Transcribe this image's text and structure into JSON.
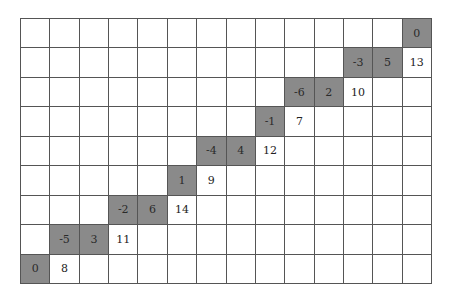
{
  "grid": {
    "rows": 9,
    "cols": 14,
    "shade_color": "#8a8a8a",
    "cells": [
      {
        "r": 0,
        "c": 13,
        "value": "0",
        "shaded": true
      },
      {
        "r": 1,
        "c": 11,
        "value": "-3",
        "shaded": true
      },
      {
        "r": 1,
        "c": 12,
        "value": "5",
        "shaded": true
      },
      {
        "r": 1,
        "c": 13,
        "value": "13",
        "shaded": false
      },
      {
        "r": 2,
        "c": 9,
        "value": "-6",
        "shaded": true
      },
      {
        "r": 2,
        "c": 10,
        "value": "2",
        "shaded": true
      },
      {
        "r": 2,
        "c": 11,
        "value": "10",
        "shaded": false
      },
      {
        "r": 3,
        "c": 8,
        "value": "-1",
        "shaded": true
      },
      {
        "r": 3,
        "c": 9,
        "value": "7",
        "shaded": false
      },
      {
        "r": 4,
        "c": 6,
        "value": "-4",
        "shaded": true
      },
      {
        "r": 4,
        "c": 7,
        "value": "4",
        "shaded": true
      },
      {
        "r": 4,
        "c": 8,
        "value": "12",
        "shaded": false
      },
      {
        "r": 5,
        "c": 5,
        "value": "1",
        "shaded": true
      },
      {
        "r": 5,
        "c": 6,
        "value": "9",
        "shaded": false
      },
      {
        "r": 6,
        "c": 3,
        "value": "-2",
        "shaded": true
      },
      {
        "r": 6,
        "c": 4,
        "value": "6",
        "shaded": true
      },
      {
        "r": 6,
        "c": 5,
        "value": "14",
        "shaded": false
      },
      {
        "r": 7,
        "c": 1,
        "value": "-5",
        "shaded": true
      },
      {
        "r": 7,
        "c": 2,
        "value": "3",
        "shaded": true
      },
      {
        "r": 7,
        "c": 3,
        "value": "11",
        "shaded": false
      },
      {
        "r": 8,
        "c": 0,
        "value": "0",
        "shaded": true
      },
      {
        "r": 8,
        "c": 1,
        "value": "8",
        "shaded": false
      }
    ]
  }
}
